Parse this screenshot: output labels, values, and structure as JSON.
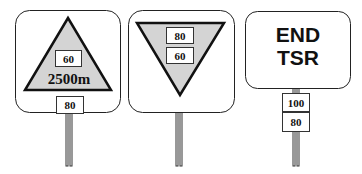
{
  "signs": [
    {
      "name": "warning-sign",
      "shape": "upright-triangle",
      "speed_in_triangle": "60",
      "distance": "2500m",
      "plate_below": "80"
    },
    {
      "name": "speed-restriction-sign",
      "shape": "inverted-triangle",
      "speeds": [
        "80",
        "60"
      ]
    },
    {
      "name": "end-tsr-sign",
      "text_line1": "END",
      "text_line2": "TSR",
      "plates_below": [
        "100",
        "80"
      ]
    }
  ],
  "colors": {
    "triangle_fill": "#d4d4d4",
    "stroke": "#111111",
    "background": "#ffffff"
  }
}
